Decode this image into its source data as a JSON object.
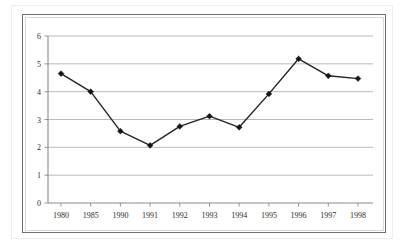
{
  "chart_data": {
    "type": "line",
    "title": "",
    "subtitle": "",
    "xlabel": "",
    "ylabel": "",
    "categories": [
      "1980",
      "1985",
      "1990",
      "1991",
      "1992",
      "1993",
      "1994",
      "1995",
      "1996",
      "1997",
      "1998"
    ],
    "values": [
      4.65,
      4.0,
      2.58,
      2.07,
      2.75,
      3.12,
      2.72,
      3.92,
      5.18,
      4.57,
      4.47
    ],
    "series": [
      {
        "name": "Series 1",
        "values": [
          4.65,
          4.0,
          2.58,
          2.07,
          2.75,
          3.12,
          2.72,
          3.92,
          5.18,
          4.57,
          4.47
        ]
      }
    ],
    "ylim": [
      0,
      6
    ],
    "yticks": [
      "0",
      "1",
      "2",
      "3",
      "4",
      "5",
      "6"
    ],
    "ytick_values": [
      0,
      1,
      2,
      3,
      4,
      5,
      6
    ],
    "grid": "horizontal",
    "legend": "none",
    "marker": "diamond",
    "line_color": "#232323",
    "marker_color": "#151515",
    "grid_color": "#a8a8a8",
    "axis_color": "#8a8a8a",
    "border_color": "#6f6f6f",
    "background_color": "#ffffff"
  }
}
